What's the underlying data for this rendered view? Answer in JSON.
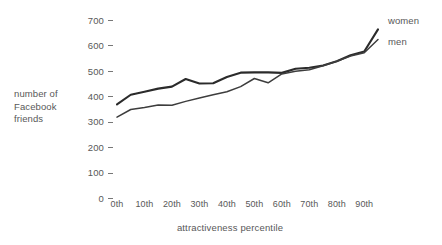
{
  "chart_data": {
    "type": "line",
    "title": "",
    "xlabel": "attractiveness percentile",
    "ylabel": "number of Facebook friends",
    "categories": [
      "0th",
      "5th",
      "10th",
      "15th",
      "20th",
      "25th",
      "30th",
      "35th",
      "40th",
      "45th",
      "50th",
      "55th",
      "60th",
      "65th",
      "70th",
      "75th",
      "80th",
      "85th",
      "90th",
      "95th"
    ],
    "x": [
      0,
      5,
      10,
      15,
      20,
      25,
      30,
      35,
      40,
      45,
      50,
      55,
      60,
      65,
      70,
      75,
      80,
      85,
      90,
      95
    ],
    "xlim": [
      0,
      95
    ],
    "ylim": [
      0,
      700
    ],
    "yticks": [
      0,
      100,
      200,
      300,
      400,
      500,
      600,
      700
    ],
    "xticks": [
      "0th",
      "10th",
      "20th",
      "30th",
      "40th",
      "50th",
      "60th",
      "70th",
      "80th",
      "90th"
    ],
    "grid": false,
    "legend_position": "right",
    "series": [
      {
        "name": "women",
        "color": "#2b2b2b",
        "values": [
          370,
          408,
          420,
          432,
          440,
          470,
          452,
          453,
          478,
          495,
          496,
          496,
          494,
          510,
          514,
          523,
          540,
          563,
          578,
          665
        ]
      },
      {
        "name": "men",
        "color": "#3d3d3d",
        "values": [
          320,
          350,
          358,
          368,
          367,
          382,
          395,
          408,
          420,
          440,
          472,
          455,
          490,
          500,
          506,
          522,
          540,
          560,
          573,
          625
        ]
      }
    ]
  },
  "axes": {
    "y_label_lines": [
      "number of",
      "Facebook",
      "friends"
    ],
    "y_tick_labels": [
      "700",
      "600",
      "500",
      "400",
      "300",
      "200",
      "100",
      "0"
    ],
    "x_tick_labels": [
      "0th",
      "10th",
      "20th",
      "30th",
      "40th",
      "50th",
      "60th",
      "70th",
      "80th",
      "90th"
    ],
    "x_title": "attractiveness percentile"
  },
  "legend": {
    "women": "women",
    "men": "men"
  }
}
